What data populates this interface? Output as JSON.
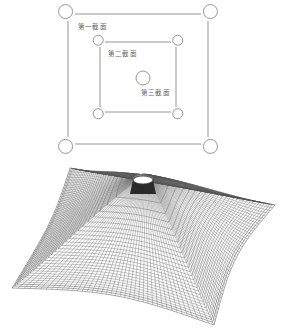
{
  "plan_view": {
    "outer_section": {
      "label": "第一截面",
      "rect": [
        68,
        14,
        208,
        144
      ],
      "corner_radius": 7
    },
    "middle_section": {
      "label": "第二截面",
      "rect": [
        100,
        42,
        176,
        112
      ],
      "corner_radius": 5
    },
    "inner_section": {
      "label": "第三截面",
      "circle": {
        "cx": 143,
        "cy": 78,
        "r": 7
      }
    },
    "line_color": "#8a8a8a"
  },
  "mesh_view": {
    "description": "3D wireframe membrane surface (tensile tent form) with central mast cap",
    "corners": {
      "top": [
        70,
        168
      ],
      "right": [
        275,
        205
      ],
      "bottom": [
        214,
        325
      ],
      "left": [
        12,
        288
      ]
    },
    "mast_top": {
      "cx": 143,
      "cy": 180,
      "rx": 10,
      "ry": 4
    },
    "line_color": "#555555"
  }
}
